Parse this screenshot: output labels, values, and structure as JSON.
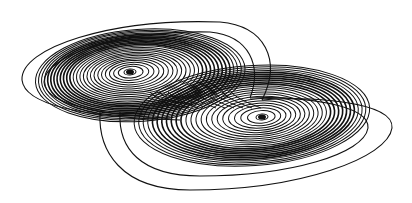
{
  "figure": {
    "width": 412,
    "height": 203,
    "background": "#ffffff",
    "stroke_color": "#111111"
  },
  "scrolls": [
    {
      "name": "left-scroll",
      "center": [
        130,
        72
      ],
      "rx_outer": 105,
      "ry_outer": 46,
      "rx_inner": 6,
      "ry_inner": 3,
      "turns": 26,
      "tilt": -4,
      "offset_x": 10
    },
    {
      "name": "right-scroll",
      "center": [
        262,
        117
      ],
      "rx_outer": 118,
      "ry_outer": 50,
      "rx_inner": 6,
      "ry_inner": 3,
      "turns": 24,
      "tilt": -4,
      "offset_x": -10
    }
  ],
  "outer_loops": [
    "M 180 120 C 110 118, 25 110, 22 80 C 20 48, 110 18, 220 22 C 265 26, 282 60, 262 100",
    "M 262 100 C 300 96, 395 100, 392 128 C 388 158, 300 190, 190 190 C 120 190, 98 150, 100 112",
    "M 170 118 C 120 116, 45 108, 44 82 C 44 56, 120 30, 210 32 C 250 36, 262 66, 250 98",
    "M 250 98 C 300 96, 370 104, 368 128 C 364 154, 290 176, 200 176 C 140 176, 118 148, 120 112"
  ]
}
